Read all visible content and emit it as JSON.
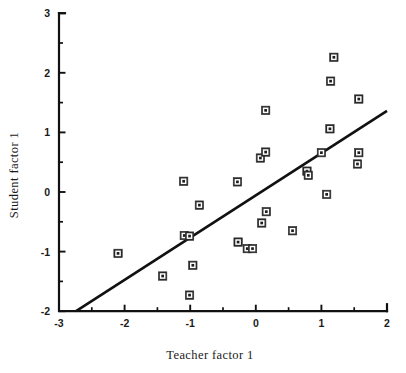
{
  "figure": {
    "name": "scatter-plot-teacher-student-factor",
    "background_color": "#ffffff",
    "foreground_color": "#111111",
    "width": 406,
    "height": 373
  },
  "chart_data": {
    "type": "scatter",
    "title": "",
    "xlabel": "Teacher factor 1",
    "ylabel": "Student factor 1",
    "xlim": [
      -3,
      2
    ],
    "ylim": [
      -2,
      3
    ],
    "xticks": [
      -3,
      -2,
      -1,
      0,
      1,
      2
    ],
    "xtick_labels": [
      "-3",
      "-2",
      "-1",
      "0",
      "1",
      "2"
    ],
    "xminorticks": [
      -2.5,
      -1.5,
      -0.5,
      0.5,
      1.5
    ],
    "yticks": [
      -2,
      -1,
      0,
      1,
      2,
      3
    ],
    "ytick_labels": [
      "-2",
      "-1",
      "0",
      "1",
      "2",
      "3"
    ],
    "yminorticks": [
      -1.5,
      -0.5,
      0.5,
      1.5,
      2.5
    ],
    "grid": false,
    "legend": null,
    "marker_style": "square-with-center-dot",
    "points": [
      {
        "x": -2.1,
        "y": -1.03
      },
      {
        "x": -1.42,
        "y": -1.41
      },
      {
        "x": -1.1,
        "y": 0.18
      },
      {
        "x": -1.09,
        "y": -0.73
      },
      {
        "x": -1.01,
        "y": -0.74
      },
      {
        "x": -1.01,
        "y": -1.73
      },
      {
        "x": -0.96,
        "y": -1.23
      },
      {
        "x": -0.86,
        "y": -0.22
      },
      {
        "x": -0.28,
        "y": 0.17
      },
      {
        "x": -0.27,
        "y": -0.84
      },
      {
        "x": -0.13,
        "y": -0.95
      },
      {
        "x": -0.05,
        "y": -0.95
      },
      {
        "x": 0.07,
        "y": 0.57
      },
      {
        "x": 0.09,
        "y": -0.52
      },
      {
        "x": 0.15,
        "y": 0.67
      },
      {
        "x": 0.15,
        "y": 1.37
      },
      {
        "x": 0.16,
        "y": -0.33
      },
      {
        "x": 0.56,
        "y": -0.65
      },
      {
        "x": 0.78,
        "y": 0.35
      },
      {
        "x": 0.8,
        "y": 0.28
      },
      {
        "x": 1.0,
        "y": 0.66
      },
      {
        "x": 1.08,
        "y": -0.04
      },
      {
        "x": 1.13,
        "y": 1.06
      },
      {
        "x": 1.14,
        "y": 1.86
      },
      {
        "x": 1.19,
        "y": 2.26
      },
      {
        "x": 1.55,
        "y": 0.47
      },
      {
        "x": 1.57,
        "y": 0.66
      },
      {
        "x": 1.57,
        "y": 1.56
      }
    ],
    "fit_line": {
      "kind": "linear-regression",
      "slope": 0.71,
      "intercept": -0.06,
      "x_start": -2.74,
      "y_start": -2.0,
      "x_end": 2.0,
      "y_end": 1.36
    }
  }
}
